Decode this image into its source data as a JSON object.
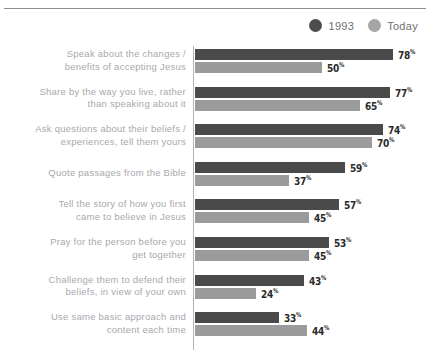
{
  "clipped_header_text": "",
  "legend": {
    "position": "top-right",
    "entries": [
      {
        "label": "1993",
        "color": "#4d4d4d",
        "key": "past"
      },
      {
        "label": "Today",
        "color": "#a5a5a5",
        "key": "today"
      }
    ]
  },
  "chart_data": {
    "type": "bar",
    "orientation": "horizontal",
    "title": "",
    "subtitle": "",
    "xlabel": "",
    "ylabel": "",
    "xlim": [
      0,
      100
    ],
    "grid": false,
    "value_suffix": "%",
    "legend_position": "top-right",
    "categories": [
      "Speak about the changes / benefits of accepting Jesus",
      "Share by the way you live, rather than speaking about it",
      "Ask questions about their beliefs / experiences, tell them yours",
      "Quote passages from the Bible",
      "Tell the story of how you first came to believe in Jesus",
      "Pray for the person before you get together",
      "Challenge them to defend their beliefs, in view of your own",
      "Use same basic approach and content each time"
    ],
    "category_lines": [
      [
        "Speak about the changes /",
        "benefits of accepting Jesus"
      ],
      [
        "Share by the way you live, rather",
        "than speaking about it"
      ],
      [
        "Ask questions about their beliefs /",
        "experiences, tell them yours"
      ],
      [
        "Quote passages from the Bible"
      ],
      [
        "Tell the story of how you first",
        "came to believe in Jesus"
      ],
      [
        "Pray for the person before you",
        "get together"
      ],
      [
        "Challenge them to defend their",
        "beliefs, in view of your own"
      ],
      [
        "Use same basic approach and",
        "content each time"
      ]
    ],
    "series": [
      {
        "name": "1993",
        "color": "#4a4a4a",
        "values": [
          78,
          77,
          74,
          59,
          57,
          53,
          43,
          33
        ],
        "labels": [
          "78%",
          "77%",
          "74%",
          "59%",
          "57%",
          "53%",
          "43%",
          "33%"
        ]
      },
      {
        "name": "Today",
        "color": "#9b9b9b",
        "values": [
          50,
          65,
          70,
          37,
          45,
          45,
          24,
          44
        ],
        "labels": [
          "50%",
          "65%",
          "70%",
          "37%",
          "45%",
          "45%",
          "24%",
          "44%"
        ]
      }
    ]
  },
  "colors": {
    "past_bar": "#4a4a4a",
    "today_bar": "#9b9b9b",
    "axis": "#b4b4b8",
    "rule": "#8d8d92",
    "category_text": "#a8a8ad",
    "value_text": "#2b2b2b",
    "legend_text": "#6f6f74",
    "background": "#ffffff"
  }
}
